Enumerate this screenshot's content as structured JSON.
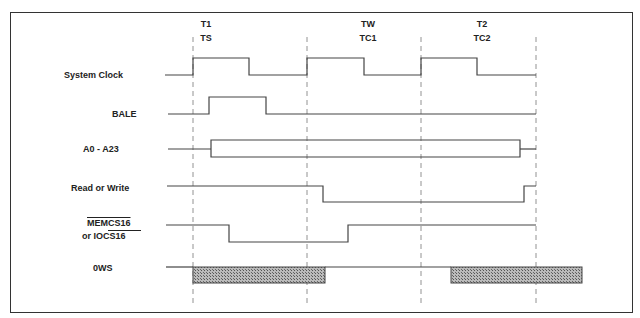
{
  "phases": [
    {
      "top": "T1",
      "bottom": "TS"
    },
    {
      "top": "TW",
      "bottom": "TC1"
    },
    {
      "top": "T2",
      "bottom": "TC2"
    }
  ],
  "signals": [
    {
      "label": "System Clock"
    },
    {
      "label": "BALE"
    },
    {
      "label": "A0 - A23"
    },
    {
      "label": "Read or Write"
    },
    {
      "label": "MEMCS16",
      "label2": "or IOCS16"
    },
    {
      "label": "0WS"
    }
  ],
  "colors": {
    "line": "#444444",
    "dash": "#777777",
    "hatch": "#999999"
  }
}
